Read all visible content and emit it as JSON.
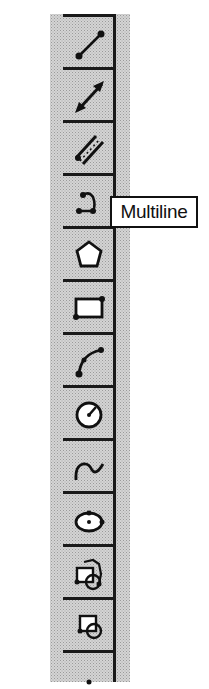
{
  "toolbar": {
    "name": "draw-toolbar",
    "buttons": [
      {
        "id": "line",
        "icon": "line-icon"
      },
      {
        "id": "dimension",
        "icon": "double-arrow-line-icon"
      },
      {
        "id": "double-line",
        "icon": "double-line-icon"
      },
      {
        "id": "multiline",
        "icon": "multiline-icon"
      },
      {
        "id": "polygon",
        "icon": "polygon-icon"
      },
      {
        "id": "rectangle",
        "icon": "rectangle-icon"
      },
      {
        "id": "arc",
        "icon": "arc-icon"
      },
      {
        "id": "circle",
        "icon": "circle-icon"
      },
      {
        "id": "spline",
        "icon": "spline-icon"
      },
      {
        "id": "ellipse",
        "icon": "ellipse-icon"
      },
      {
        "id": "insert-block-multi",
        "icon": "insert-block-multi-icon"
      },
      {
        "id": "insert-block",
        "icon": "insert-block-icon"
      },
      {
        "id": "point",
        "icon": "point-icon"
      }
    ]
  },
  "tooltip": {
    "text": "Multiline",
    "target": "multiline"
  },
  "colors": {
    "toolbar_bg": "#d4d4d4",
    "ink": "#1a1a1a",
    "tooltip_bg": "#ffffff"
  }
}
